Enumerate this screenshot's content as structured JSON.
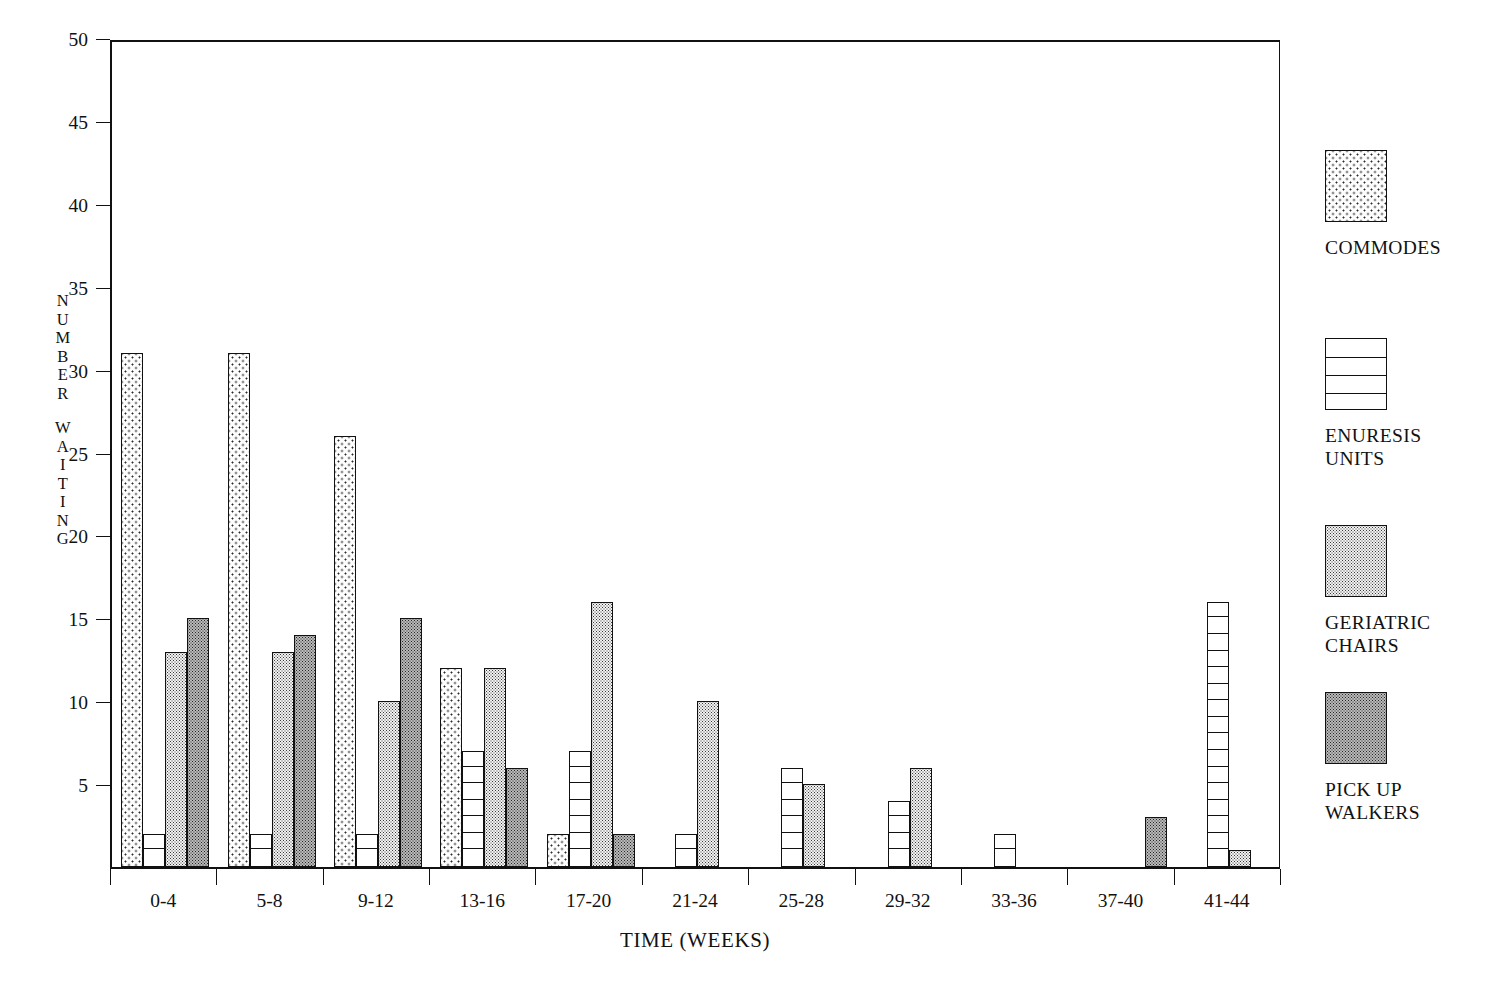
{
  "chart_data": {
    "type": "bar",
    "title": "",
    "xlabel": "TIME (WEEKS)",
    "ylabel": "NUMBER WAITING",
    "ylim": [
      0,
      50
    ],
    "yticks": [
      0,
      5,
      10,
      15,
      20,
      25,
      30,
      35,
      40,
      45,
      50
    ],
    "ytick_labels": [
      "",
      "5",
      "10",
      "15",
      "20",
      "25",
      "30",
      "35",
      "40",
      "45",
      "50"
    ],
    "grid": false,
    "legend_position": "right",
    "categories": [
      "0-4",
      "5-8",
      "9-12",
      "13-16",
      "17-20",
      "21-24",
      "25-28",
      "29-32",
      "33-36",
      "37-40",
      "41-44"
    ],
    "series": [
      {
        "name": "COMMODES",
        "pattern": "sparse-dots",
        "values": [
          31,
          31,
          26,
          12,
          2,
          0,
          0,
          0,
          0,
          0,
          0
        ]
      },
      {
        "name": "ENURESIS UNITS",
        "pattern": "horizontal-rungs",
        "values": [
          2,
          2,
          2,
          7,
          7,
          2,
          6,
          4,
          2,
          0,
          16
        ]
      },
      {
        "name": "GERIATRIC CHAIRS",
        "pattern": "fine-dots-light",
        "values": [
          13,
          13,
          10,
          12,
          16,
          10,
          5,
          6,
          0,
          0,
          1
        ]
      },
      {
        "name": "PICK UP WALKERS",
        "pattern": "fine-dots-dark",
        "values": [
          15,
          14,
          15,
          6,
          2,
          0,
          0,
          0,
          0,
          3,
          0
        ]
      }
    ]
  },
  "axes": {
    "y_title_letters": [
      "N",
      "U",
      "M",
      "B",
      "E",
      "R",
      "",
      "W",
      "A",
      "I",
      "T",
      "I",
      "N",
      "G"
    ],
    "x_title": "TIME (WEEKS)"
  },
  "legend": {
    "items": [
      {
        "label": "COMMODES",
        "swatch": "sparse-dots"
      },
      {
        "label": "ENURESIS\nUNITS",
        "swatch": "horizontal-rungs"
      },
      {
        "label": "GERIATRIC\nCHAIRS",
        "swatch": "fine-dots-light"
      },
      {
        "label": "PICK UP\nWALKERS",
        "swatch": "fine-dots-dark"
      }
    ]
  },
  "colors": {
    "ink": "#111111",
    "background": "#ffffff",
    "commodes_fill": "#fdfdfd",
    "enuresis_fill": "#ffffff",
    "geriatric_fill": "#f2f2f2",
    "walkers_fill": "#b9b9b9"
  }
}
